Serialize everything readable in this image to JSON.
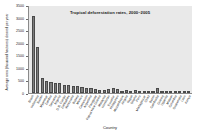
{
  "chart_data": {
    "type": "bar",
    "title": "Tropical deforestation rates, 2000–2005",
    "xlabel": "Country",
    "ylabel": "Average area (thousand hectares) cleared per year",
    "ylim": [
      0,
      3500
    ],
    "yticks": [
      0,
      500,
      1000,
      1500,
      2000,
      2500,
      3000,
      3500
    ],
    "ytick_labels": [
      "0",
      "500",
      "1000",
      "1500",
      "2000",
      "2500",
      "3000",
      "3500"
    ],
    "grid": false,
    "legend": false,
    "bar_color": "#7d7d7d",
    "plot_background": "#e9e9e9",
    "categories": [
      "Brazil",
      "Indonesia",
      "Sudan",
      "Myanmar",
      "Zambia",
      "Tanzania",
      "Nigeria",
      "D.R. Congo",
      "Zimbabwe",
      "Venezuela",
      "Bolivia",
      "Mexico",
      "Cameroon",
      "Argentina",
      "Paraguay",
      "Papua New Guinea",
      "Malaysia",
      "Honduras",
      "Ecuador",
      "Philippines",
      "Mozambique",
      "Angola",
      "Nepal",
      "Ghana",
      "Peru",
      "Madagascar",
      "Chad",
      "Benin",
      "Cambodia",
      "Guinea",
      "Uganda",
      "Malawi",
      "Colombia",
      "Guatemala",
      "Laos",
      "Kenya"
    ],
    "values": [
      3103,
      1871,
      589,
      466,
      445,
      412,
      410,
      319,
      313,
      288,
      270,
      260,
      220,
      215,
      179,
      139,
      140,
      156,
      198,
      157,
      50,
      125,
      53,
      115,
      94,
      37,
      79,
      65,
      219,
      36,
      86,
      33,
      47,
      54,
      78,
      12
    ]
  }
}
